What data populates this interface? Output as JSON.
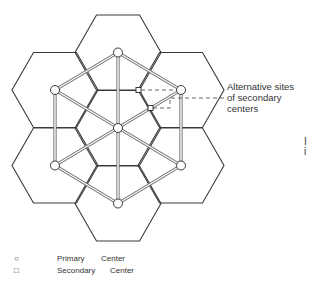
{
  "diagram": {
    "type": "hexagonal central place network",
    "annotation": {
      "lines": [
        "Alternative sites",
        "of secondary",
        "centers"
      ]
    },
    "legend": [
      {
        "symbol": "circle",
        "symbol_glyph": "○",
        "words": [
          "Primary",
          "Center"
        ]
      },
      {
        "symbol": "square",
        "symbol_glyph": "□",
        "words": [
          "Secondary",
          "Center"
        ]
      }
    ],
    "edge_text": [
      "I",
      "i"
    ],
    "primary_centers": 7,
    "secondary_centers": 2,
    "colors": {
      "line": "#3a3a3a",
      "background": "#ffffff"
    }
  }
}
